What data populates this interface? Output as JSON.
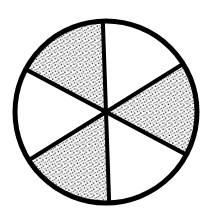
{
  "figure": {
    "name": "fraction-circle-diagram",
    "title": "Circle divided into six equal sectors with alternating shading",
    "background_color": "#ffffff",
    "stroke_color": "#000000",
    "fill_shaded_color": "#000000",
    "fill_unshaded_color": "#ffffff",
    "width": 212,
    "height": 220
  },
  "chart_data": {
    "type": "pie",
    "title": "",
    "xlabel": "",
    "ylabel": "",
    "legend": [],
    "grid": false,
    "center_x": 106,
    "center_y": 112,
    "radius": 92,
    "outline_width": 5,
    "divider_width": 4,
    "rotation_deg": -2,
    "total_slices": 6,
    "shaded_count": 3,
    "unshaded_count": 3,
    "fraction_shaded": "3/6",
    "fraction_simplified": "1/2",
    "percent_shaded": 50,
    "categories": [
      "sector-1-top-right",
      "sector-2-right",
      "sector-3-bottom-right",
      "sector-4-bottom-left",
      "sector-5-left",
      "sector-6-top-left"
    ],
    "values": [
      60,
      60,
      60,
      60,
      60,
      60
    ],
    "slices": [
      {
        "index": 1,
        "name": "sector-top-right",
        "start_angle": -90,
        "end_angle": -30,
        "angle_span": 60,
        "shaded": false,
        "fill": "#ffffff"
      },
      {
        "index": 2,
        "name": "sector-right",
        "start_angle": -30,
        "end_angle": 30,
        "angle_span": 60,
        "shaded": true,
        "fill": "stipple"
      },
      {
        "index": 3,
        "name": "sector-bottom-right",
        "start_angle": 30,
        "end_angle": 90,
        "angle_span": 60,
        "shaded": false,
        "fill": "#ffffff"
      },
      {
        "index": 4,
        "name": "sector-bottom-left",
        "start_angle": 90,
        "end_angle": 150,
        "angle_span": 60,
        "shaded": true,
        "fill": "stipple"
      },
      {
        "index": 5,
        "name": "sector-left",
        "start_angle": 150,
        "end_angle": 210,
        "angle_span": 60,
        "shaded": false,
        "fill": "#ffffff"
      },
      {
        "index": 6,
        "name": "sector-top-left",
        "start_angle": 210,
        "end_angle": 270,
        "angle_span": 60,
        "shaded": true,
        "fill": "stipple"
      }
    ],
    "stipple": {
      "pattern": "dotted-texture",
      "dot_spacing": 3.1,
      "dot_size": 1.25,
      "dot_color": "#1a1a1a"
    }
  }
}
